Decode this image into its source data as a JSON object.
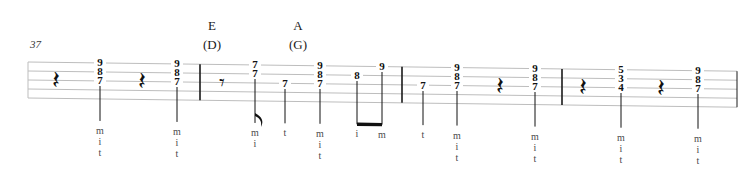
{
  "score": {
    "measure_number": "37",
    "staff": {
      "lines": 5,
      "x_start": 28,
      "x_end": 737,
      "y_top": 62,
      "line_gap": 9
    },
    "chords": [
      {
        "name": "E",
        "alt": "(D)",
        "x": 212,
        "y": 18
      },
      {
        "name": "A",
        "alt": "(G)",
        "x": 298,
        "y": 18
      }
    ],
    "barlines": [
      200,
      402,
      562,
      737
    ],
    "measures": [
      {
        "index": 1,
        "events": [
          {
            "type": "rest",
            "value": "quarter",
            "glyph": "𝄽",
            "x": 56
          },
          {
            "type": "chord",
            "frets": [
              "9",
              "8",
              "7"
            ],
            "strings": [
              1,
              2,
              3
            ],
            "x": 100,
            "stem": true,
            "fingering": [
              "m",
              "i",
              "t"
            ]
          },
          {
            "type": "rest",
            "value": "quarter",
            "glyph": "𝄽",
            "x": 142
          },
          {
            "type": "chord",
            "frets": [
              "9",
              "8",
              "7"
            ],
            "strings": [
              1,
              2,
              3
            ],
            "x": 177,
            "stem": true,
            "fingering": [
              "m",
              "i",
              "t"
            ]
          }
        ]
      },
      {
        "index": 2,
        "events": [
          {
            "type": "rest",
            "value": "eighth",
            "glyph": "𝄾",
            "x": 222
          },
          {
            "type": "chord",
            "frets": [
              "7",
              "7"
            ],
            "strings": [
              1,
              2
            ],
            "x": 255,
            "stem": true,
            "flag": "eighth",
            "fingering": [
              "m",
              "i"
            ]
          },
          {
            "type": "note",
            "fret": "7",
            "string": 3,
            "x": 285,
            "stem": true,
            "fingering": [
              "t"
            ]
          },
          {
            "type": "chord",
            "frets": [
              "9",
              "8",
              "7"
            ],
            "strings": [
              1,
              2,
              3
            ],
            "x": 320,
            "stem": true,
            "fingering": [
              "m",
              "i",
              "t"
            ]
          },
          {
            "type": "note",
            "fret": "8",
            "string": 2,
            "x": 357,
            "stem": true,
            "beam": "start",
            "fingering": [
              "i"
            ]
          },
          {
            "type": "note",
            "fret": "9",
            "string": 1,
            "x": 382,
            "stem": true,
            "beam": "end",
            "fingering": [
              "m"
            ]
          }
        ]
      },
      {
        "index": 3,
        "events": [
          {
            "type": "note",
            "fret": "7",
            "string": 3,
            "x": 423,
            "stem": true,
            "fingering": [
              "t"
            ]
          },
          {
            "type": "chord",
            "frets": [
              "9",
              "8",
              "7"
            ],
            "strings": [
              1,
              2,
              3
            ],
            "x": 457,
            "stem": true,
            "fingering": [
              "m",
              "i",
              "t"
            ]
          },
          {
            "type": "rest",
            "value": "quarter",
            "glyph": "𝄽",
            "x": 500
          },
          {
            "type": "chord",
            "frets": [
              "9",
              "8",
              "7"
            ],
            "strings": [
              1,
              2,
              3
            ],
            "x": 535,
            "stem": true,
            "fingering": [
              "m",
              "i",
              "t"
            ]
          }
        ]
      },
      {
        "index": 4,
        "events": [
          {
            "type": "rest",
            "value": "quarter",
            "glyph": "𝄽",
            "x": 583
          },
          {
            "type": "chord",
            "frets": [
              "5",
              "3",
              "4"
            ],
            "strings": [
              1,
              2,
              3
            ],
            "x": 621,
            "stem": true,
            "fingering": [
              "m",
              "i",
              "t"
            ]
          },
          {
            "type": "rest",
            "value": "quarter",
            "glyph": "𝄽",
            "x": 661
          },
          {
            "type": "chord",
            "frets": [
              "9",
              "8",
              "7"
            ],
            "strings": [
              1,
              2,
              3
            ],
            "x": 698,
            "stem": true,
            "fingering": [
              "m",
              "i",
              "t"
            ]
          }
        ]
      }
    ],
    "colors": {
      "staff_line": "#bdbdbd",
      "barline": "#1a1a1a",
      "note": "#111111",
      "fingering": "#4a4a4a",
      "measure_number": "#3a3a3a"
    }
  }
}
